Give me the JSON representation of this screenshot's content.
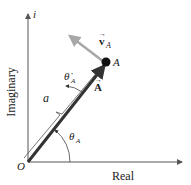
{
  "diagram": {
    "axes": {
      "vertical_label": "Imaginary",
      "vertical_unit": "i",
      "horizontal_label": "Real",
      "origin_label": "O"
    },
    "vector": {
      "name": "A",
      "symbol": "A",
      "point_label": "A",
      "magnitude_label": "a",
      "angle_label": "θ",
      "angle_sub": "A",
      "angular_rate_label": "θ̇",
      "angular_rate_sub": "A"
    },
    "velocity": {
      "symbol": "v",
      "sub": "A"
    },
    "colors": {
      "axis": "#555555",
      "vector": "#333333",
      "velocity": "#a8a8a8",
      "point": "#111111"
    }
  }
}
